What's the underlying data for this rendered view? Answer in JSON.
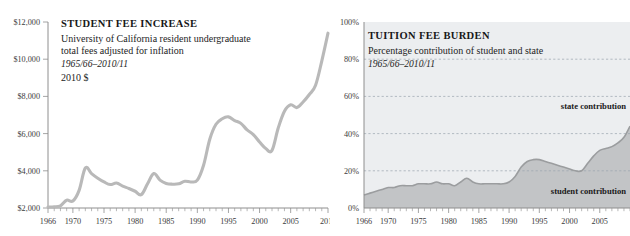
{
  "left_panel": {
    "title": "STUDENT FEE INCREASE",
    "subtitle_line1": "University of California resident undergraduate",
    "subtitle_line2": "total fees adjusted for inflation",
    "period": "1965/66–2010/11",
    "units": "2010 $"
  },
  "right_panel": {
    "title": "TUITION FEE BURDEN",
    "subtitle_line1": "Percentage contribution of student and state",
    "period": "1965/66–2010/11",
    "label_state": "state contribution",
    "label_student": "student contribution"
  },
  "colors": {
    "line": "#b9b9b9",
    "state_area": "#eceef0",
    "student_area": "#c2c4c6",
    "grid": "#9aa3ad",
    "axis": "#8e8e8e",
    "text": "#1a1a1a",
    "background": "#ffffff"
  },
  "chart_data": [
    {
      "id": "student-fee-increase",
      "type": "line",
      "title": "STUDENT FEE INCREASE",
      "subtitle": "University of California resident undergraduate total fees adjusted for inflation",
      "period": "1965/66–2010/11",
      "units": "2010 $",
      "xlabel": "",
      "ylabel": "",
      "xlim": [
        1966,
        2011
      ],
      "ylim": [
        2000,
        12000
      ],
      "ytick_labels": [
        "$2,000",
        "$4,000",
        "$6,000",
        "$8,000",
        "$10,000",
        "$12,000"
      ],
      "ytick_values": [
        2000,
        4000,
        6000,
        8000,
        10000,
        12000
      ],
      "xtick_labels": [
        "1966",
        "1970",
        "1975",
        "1980",
        "1985",
        "1990",
        "1995",
        "2000",
        "2005",
        "2011"
      ],
      "xtick_values": [
        1966,
        1970,
        1975,
        1980,
        1985,
        1990,
        1995,
        2000,
        2005,
        2011
      ],
      "grid": false,
      "legend": "none",
      "x": [
        1966,
        1967,
        1968,
        1969,
        1970,
        1971,
        1972,
        1973,
        1974,
        1975,
        1976,
        1977,
        1978,
        1979,
        1980,
        1981,
        1982,
        1983,
        1984,
        1985,
        1986,
        1987,
        1988,
        1989,
        1990,
        1991,
        1992,
        1993,
        1994,
        1995,
        1996,
        1997,
        1998,
        1999,
        2000,
        2001,
        2002,
        2003,
        2004,
        2005,
        2006,
        2007,
        2008,
        2009,
        2010,
        2011
      ],
      "values": [
        2050,
        2060,
        2120,
        2420,
        2380,
        2950,
        4150,
        3850,
        3600,
        3400,
        3260,
        3340,
        3180,
        3050,
        2900,
        2720,
        3300,
        3850,
        3500,
        3320,
        3280,
        3300,
        3440,
        3400,
        3500,
        4300,
        5700,
        6500,
        6800,
        6900,
        6700,
        6550,
        6200,
        5950,
        5550,
        5200,
        5100,
        6300,
        7200,
        7550,
        7400,
        7700,
        8100,
        8600,
        9900,
        11400
      ]
    },
    {
      "id": "tuition-fee-burden",
      "type": "area",
      "title": "TUITION FEE BURDEN",
      "subtitle": "Percentage contribution of student and state",
      "period": "1965/66–2010/11",
      "xlabel": "",
      "ylabel": "",
      "xlim": [
        1966,
        2010
      ],
      "ylim": [
        0,
        100
      ],
      "ytick_labels": [
        "0%",
        "20%",
        "40%",
        "60%",
        "80%",
        "100%"
      ],
      "ytick_values": [
        0,
        20,
        40,
        60,
        80,
        100
      ],
      "xtick_labels": [
        "1966",
        "1970",
        "1975",
        "1980",
        "1985",
        "1990",
        "1995",
        "2000",
        "2005"
      ],
      "xtick_values": [
        1966,
        1970,
        1975,
        1980,
        1985,
        1990,
        1995,
        2000,
        2005
      ],
      "grid": true,
      "gridlines_y": [
        20,
        40,
        60,
        80
      ],
      "stacked": true,
      "annotations": [
        {
          "text": "state contribution",
          "x": 2004,
          "y": 58
        },
        {
          "text": "student contribution",
          "x": 2004,
          "y": 10
        }
      ],
      "x": [
        1966,
        1967,
        1968,
        1969,
        1970,
        1971,
        1972,
        1973,
        1974,
        1975,
        1976,
        1977,
        1978,
        1979,
        1980,
        1981,
        1982,
        1983,
        1984,
        1985,
        1986,
        1987,
        1988,
        1989,
        1990,
        1991,
        1992,
        1993,
        1994,
        1995,
        1996,
        1997,
        1998,
        1999,
        2000,
        2001,
        2002,
        2003,
        2004,
        2005,
        2006,
        2007,
        2008,
        2009,
        2010
      ],
      "series": [
        {
          "name": "student contribution",
          "values": [
            7,
            8,
            9,
            10,
            11,
            11,
            12,
            12,
            12,
            13,
            13,
            13,
            14,
            13,
            13,
            12,
            14,
            16,
            14,
            13,
            13,
            13,
            13,
            13,
            14,
            17,
            22,
            25,
            26,
            26,
            25,
            24,
            23,
            22,
            21,
            20,
            20,
            24,
            28,
            31,
            32,
            33,
            35,
            38,
            44
          ]
        },
        {
          "name": "state contribution",
          "values": [
            93,
            92,
            91,
            90,
            89,
            89,
            88,
            88,
            88,
            87,
            87,
            87,
            86,
            87,
            87,
            88,
            86,
            84,
            86,
            87,
            87,
            87,
            87,
            87,
            86,
            83,
            78,
            75,
            74,
            74,
            75,
            76,
            77,
            78,
            79,
            80,
            80,
            76,
            72,
            69,
            68,
            67,
            65,
            62,
            56
          ]
        }
      ]
    }
  ]
}
